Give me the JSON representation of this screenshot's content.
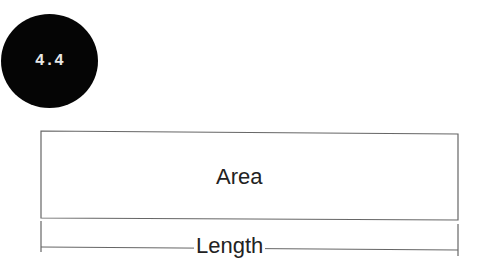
{
  "badge": {
    "label": "4.4",
    "color": "#050505"
  },
  "diagram": {
    "area_label": "Area",
    "length_label": "Length",
    "line_color": "#555555"
  }
}
